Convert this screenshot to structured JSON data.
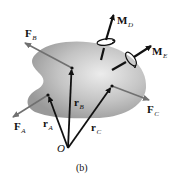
{
  "figure": {
    "caption": "(b)",
    "origin_label": "O",
    "body": {
      "fill_light": "#e8e8e8",
      "fill_dark": "#9a9a9a"
    },
    "colors": {
      "position_vector": "#111111",
      "force": "#707070",
      "moment": "#111111"
    },
    "points": {
      "O": [
        68,
        148
      ],
      "A": [
        48,
        95
      ],
      "B": [
        72,
        68
      ],
      "C": [
        112,
        86
      ]
    },
    "position_vectors": [
      {
        "id": "rA",
        "base": "r",
        "sub": "A",
        "from": "O",
        "to": "A"
      },
      {
        "id": "rB",
        "base": "r",
        "sub": "B",
        "from": "O",
        "to": "B"
      },
      {
        "id": "rC",
        "base": "r",
        "sub": "C",
        "from": "O",
        "to": "C"
      }
    ],
    "forces": [
      {
        "id": "FA",
        "base": "F",
        "sub": "A",
        "at": "A",
        "tip": [
          12,
          118
        ]
      },
      {
        "id": "FB",
        "base": "F",
        "sub": "B",
        "at": "B",
        "tip": [
          24,
          42
        ]
      },
      {
        "id": "FC",
        "base": "F",
        "sub": "C",
        "at": "C",
        "tip": [
          150,
          100
        ]
      }
    ],
    "moments": [
      {
        "id": "MD",
        "base": "M",
        "sub": "D",
        "tail": [
          101,
          60
        ],
        "tip": [
          114,
          14
        ]
      },
      {
        "id": "ME",
        "base": "M",
        "sub": "E",
        "tail": [
          112,
          70
        ],
        "tip": [
          152,
          45
        ]
      }
    ]
  }
}
